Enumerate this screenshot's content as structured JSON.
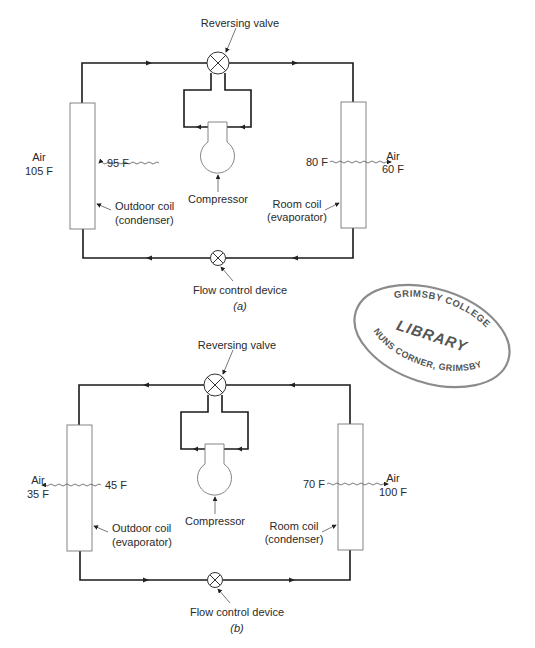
{
  "figure": {
    "panels": [
      {
        "id": "a",
        "caption": "(a)",
        "reversing_valve_label": "Reversing valve",
        "flow_control_label": "Flow control device",
        "compressor_label": "Compressor",
        "outdoor_coil": {
          "line1": "Outdoor coil",
          "line2": "(condenser)",
          "coil_temp": "95 F",
          "air_label": "Air",
          "air_temp": "105 F"
        },
        "room_coil": {
          "line1": "Room coil",
          "line2": "(evaporator)",
          "coil_temp": "80 F",
          "air_label": "Air",
          "air_temp": "60 F"
        },
        "flow_direction": "cooling"
      },
      {
        "id": "b",
        "caption": "(b)",
        "reversing_valve_label": "Reversing valve",
        "flow_control_label": "Flow control device",
        "compressor_label": "Compressor",
        "outdoor_coil": {
          "line1": "Outdoor coil",
          "line2": "(evaporator)",
          "coil_temp": "45 F",
          "air_label": "Air",
          "air_temp": "35 F"
        },
        "room_coil": {
          "line1": "Room coil",
          "line2": "(condenser)",
          "coil_temp": "70 F",
          "air_label": "Air",
          "air_temp": "100 F"
        },
        "flow_direction": "heating"
      }
    ],
    "stamp": {
      "top_text": "GRIMSBY COLLEGE",
      "center_text": "LIBRARY",
      "bottom_text": "NUNS CORNER, GRIMSBY"
    }
  }
}
